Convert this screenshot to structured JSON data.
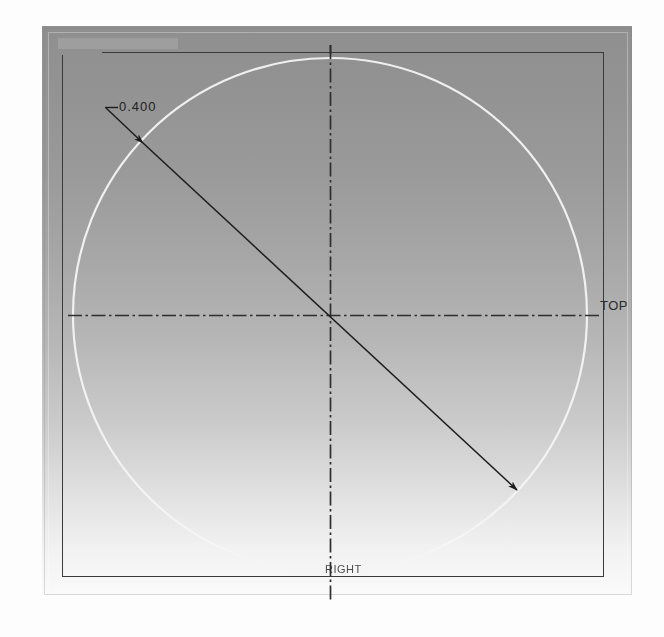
{
  "app": {
    "view_title": "CAD Drawing Viewport",
    "background_note": "gradient gray sheet"
  },
  "drawing": {
    "dimension": {
      "value_label": "0.400",
      "type": "diameter-dimension",
      "leader_tick_name": "leader-tick"
    },
    "labels": {
      "right_view_label": "TOP",
      "bottom_view_label": "RIGHT"
    },
    "geometry": {
      "circle": {
        "name": "construction-circle",
        "cx": 330,
        "cy": 315,
        "r": 257,
        "color": "#ffffff",
        "stroke_width": 2.1
      },
      "centerline_horizontal": {
        "name": "horizontal-centerline",
        "y": 315,
        "x1": 68,
        "x2": 600,
        "color": "#2b2b2b"
      },
      "centerline_vertical": {
        "name": "vertical-centerline",
        "x": 330,
        "y1": 45,
        "y2": 600,
        "color": "#2b2b2b"
      },
      "dimension_line": {
        "name": "diameter-dimension-line",
        "x1": 143,
        "y1": 143,
        "x2": 517,
        "y2": 490,
        "color": "#212121"
      },
      "leader_line": {
        "name": "dimension-leader-line",
        "x1": 143,
        "y1": 143,
        "x2": 106,
        "y2": 108,
        "tick_x2": 117,
        "color": "#212121"
      },
      "view_rectangle": {
        "name": "view-border-rectangle",
        "left": 62,
        "top": 52,
        "width": 542,
        "height": 525,
        "color": "#3a3a3a"
      },
      "sheet": {
        "name": "drawing-sheet",
        "left": 42,
        "top": 26,
        "width": 590,
        "height": 569,
        "gradient_top": "#8f8f8f",
        "gradient_bottom": "#fafafa"
      }
    }
  }
}
